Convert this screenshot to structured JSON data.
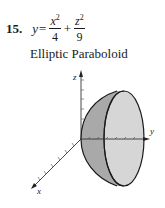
{
  "problem": {
    "number": "15.",
    "lhs": "y",
    "equals": "=",
    "term1": {
      "numerator_var": "x",
      "exponent": "2",
      "denominator": "4"
    },
    "plus": "+",
    "term2": {
      "numerator_var": "z",
      "exponent": "2",
      "denominator": "9"
    }
  },
  "caption": "Elliptic Paraboloid",
  "figure": {
    "axes": {
      "x_label": "x",
      "y_label": "y",
      "z_label": "z"
    },
    "surface": "elliptic paraboloid opening along +y axis",
    "colors": {
      "side_fill": "#a9a9a9",
      "cap_fill": "#d6d6d6",
      "stroke": "#1a1a1a"
    }
  }
}
